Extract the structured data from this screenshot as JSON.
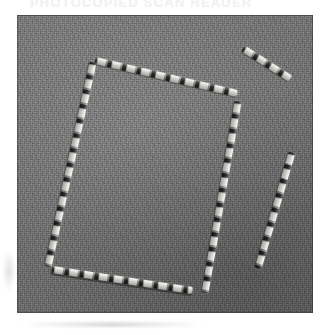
{
  "page": {
    "background_color": "#ffffff",
    "header_text": "PHOTOCOPIED SCAN HEADER"
  },
  "photo": {
    "name": "grayscale-photograph",
    "left": 17,
    "top": 15,
    "width": 296,
    "height": 298,
    "background_color": "#6e6e6e",
    "description": "Grainy grayscale photograph of bright segmented rod-like objects arranged on a uniform gray surface",
    "border_color": "#282828"
  },
  "objects": [
    {
      "name": "rod-rectangle-top-edge",
      "x1": 95,
      "y1": 60,
      "x2": 237,
      "y2": 93,
      "thickness": 7,
      "color": "#f8f8f2"
    },
    {
      "name": "rod-rectangle-left-edge",
      "x1": 93,
      "y1": 62,
      "x2": 48,
      "y2": 266,
      "thickness": 7,
      "color": "#f8f8f2"
    },
    {
      "name": "rod-rectangle-right-edge",
      "x1": 238,
      "y1": 101,
      "x2": 205,
      "y2": 292,
      "thickness": 7,
      "color": "#f8f8f2"
    },
    {
      "name": "rod-rectangle-bottom-edge",
      "x1": 52,
      "y1": 269,
      "x2": 192,
      "y2": 290,
      "thickness": 7,
      "color": "#f8f8f2"
    },
    {
      "name": "rod-short-diagonal-top-right",
      "x1": 243,
      "y1": 48,
      "x2": 290,
      "y2": 78,
      "thickness": 7,
      "color": "#f8f8f2"
    },
    {
      "name": "rod-long-right-side",
      "x1": 292,
      "y1": 152,
      "x2": 258,
      "y2": 268,
      "thickness": 7,
      "color": "#f8f8f2"
    }
  ]
}
